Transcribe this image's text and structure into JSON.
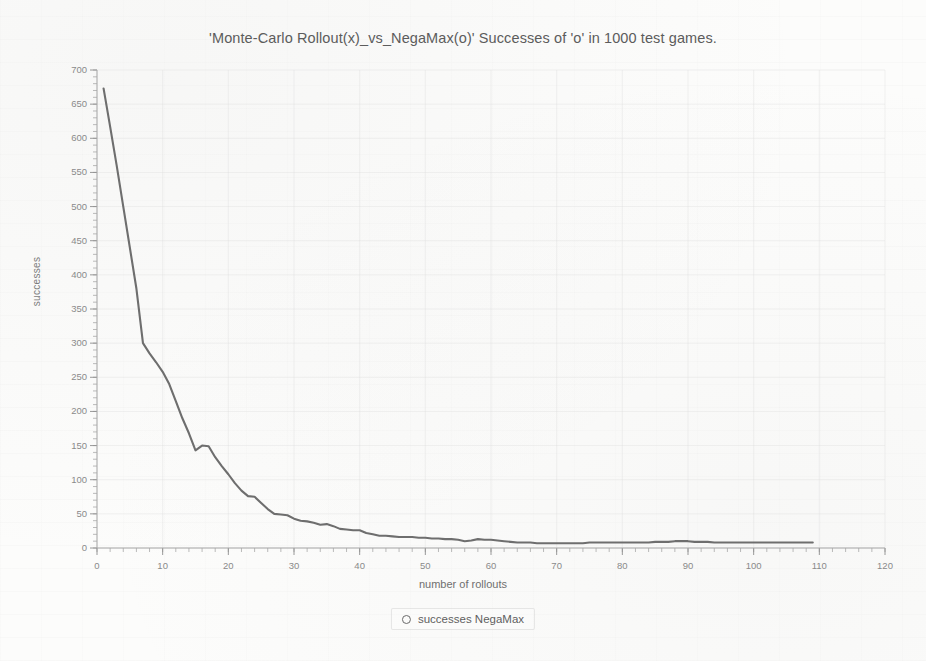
{
  "chart_data": {
    "type": "line",
    "title": "'Monte-Carlo Rollout(x)_vs_NegaMax(o)'  Successes of 'o' in 1000 test games.",
    "xlabel": "number of rollouts",
    "ylabel": "successes",
    "xlim": [
      0,
      120
    ],
    "ylim": [
      0,
      700
    ],
    "xticks": [
      0,
      10,
      20,
      30,
      40,
      50,
      60,
      70,
      80,
      90,
      100,
      110,
      120
    ],
    "yticks": [
      0,
      50,
      100,
      150,
      200,
      250,
      300,
      350,
      400,
      450,
      500,
      550,
      600,
      650,
      700
    ],
    "grid": true,
    "legend_position": "below-plot",
    "line_color": "#6e6e6e",
    "series": [
      {
        "name": "successes NegaMax",
        "marker": "circle-open",
        "x": [
          1,
          2,
          3,
          4,
          5,
          6,
          7,
          8,
          9,
          10,
          11,
          12,
          13,
          14,
          15,
          16,
          17,
          18,
          19,
          20,
          21,
          22,
          23,
          24,
          25,
          26,
          27,
          28,
          29,
          30,
          31,
          32,
          33,
          34,
          35,
          36,
          37,
          38,
          39,
          40,
          41,
          42,
          43,
          44,
          45,
          46,
          47,
          48,
          49,
          50,
          51,
          52,
          53,
          54,
          55,
          56,
          57,
          58,
          59,
          60,
          61,
          62,
          63,
          64,
          65,
          66,
          67,
          68,
          69,
          70,
          71,
          72,
          73,
          74,
          75,
          76,
          77,
          78,
          79,
          80,
          81,
          82,
          83,
          84,
          85,
          86,
          87,
          88,
          89,
          90,
          91,
          92,
          93,
          94,
          95,
          96,
          97,
          98,
          99,
          100,
          101,
          102,
          103,
          104,
          105,
          106,
          107,
          108,
          109
        ],
        "y": [
          673,
          617,
          560,
          500,
          440,
          380,
          300,
          285,
          272,
          258,
          240,
          215,
          190,
          168,
          143,
          150,
          149,
          133,
          120,
          108,
          95,
          84,
          76,
          75,
          66,
          57,
          50,
          49,
          48,
          43,
          40,
          39,
          37,
          34,
          35,
          32,
          28,
          27,
          26,
          26,
          22,
          20,
          18,
          18,
          17,
          16,
          16,
          16,
          15,
          15,
          14,
          14,
          13,
          13,
          12,
          10,
          11,
          13,
          12,
          12,
          11,
          10,
          9,
          8,
          8,
          8,
          7,
          7,
          7,
          7,
          7,
          7,
          7,
          7,
          8,
          8,
          8,
          8,
          8,
          8,
          8,
          8,
          8,
          8,
          9,
          9,
          9,
          10,
          10,
          10,
          9,
          9,
          9,
          8,
          8,
          8,
          8,
          8,
          8,
          8,
          8,
          8,
          8,
          8,
          8,
          8,
          8,
          8,
          8
        ]
      }
    ]
  },
  "legend": {
    "entries": [
      {
        "marker_glyph": "O",
        "label": "successes NegaMax"
      }
    ]
  }
}
